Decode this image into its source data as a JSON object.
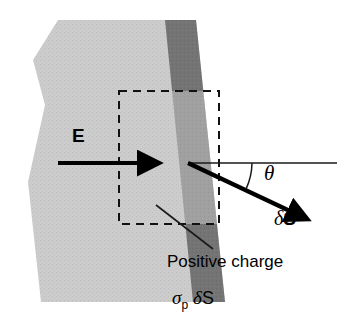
{
  "figure": {
    "background": "#ffffff"
  },
  "colors": {
    "slab_light": "#c8c8c8",
    "band_dark": "#737373",
    "band_inside_box": "#9e9e9e",
    "stroke": "#000000",
    "thin_line": "#1a1a1a"
  },
  "labels": {
    "field_vector": "E",
    "angle": "θ",
    "area_vector_delta": "δ",
    "area_vector_symbol": "S",
    "positive_charge": "Positive charge",
    "surface_charge_sigma": "σ",
    "surface_charge_subscript": "p",
    "surface_charge_delta": "δ",
    "surface_charge_area": "S"
  },
  "geometry": {
    "slab_points": "58,20 186,20 216,302 40,302 40,302",
    "e_arrow": {
      "x1": 58,
      "y1": 163,
      "x2": 150,
      "y2": 163
    },
    "horizontal_ref_line": {
      "x1": 188,
      "y1": 163,
      "x2": 337,
      "y2": 163
    },
    "ds_arrow": {
      "x1": 188,
      "y1": 163,
      "x2": 300,
      "y2": 216
    },
    "angle_arc_radius": 64,
    "angle_degrees": 25,
    "dashed_box": {
      "x": 119,
      "y": 91,
      "width": 100,
      "height": 133
    },
    "leader_line": {
      "x1": 156,
      "y1": 205,
      "x2": 213,
      "y2": 249
    }
  },
  "icons": {
    "arrowhead": "arrowhead-icon",
    "dashed_rectangle": "dashed-region-icon"
  }
}
